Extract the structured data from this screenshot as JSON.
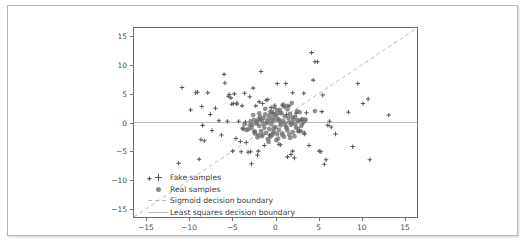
{
  "figure": {
    "background_color": "#ffffff",
    "frame_color": "#b9b9b9",
    "axes_color": "#6f6f6f"
  },
  "chart_data": {
    "type": "scatter",
    "title": "",
    "xlabel": "",
    "ylabel": "",
    "xlim": [
      -16.5,
      16.5
    ],
    "ylim": [
      -16.5,
      16.5
    ],
    "grid": false,
    "legend_position": "lower center",
    "xticks": [
      -15,
      -10,
      -5,
      0,
      5,
      10,
      15
    ],
    "yticks": [
      -15,
      -10,
      -5,
      0,
      5,
      10,
      15
    ],
    "xtick_labels": [
      "−15",
      "−10",
      "−5",
      "0",
      "5",
      "10",
      "15"
    ],
    "ytick_labels": [
      "15",
      "10",
      "5",
      "0",
      "−5",
      "−10",
      "−15"
    ],
    "series": [
      {
        "name": "Fake samples",
        "marker": "plus",
        "color": "#5a5a5a",
        "points": [
          [
            -14.7,
            -9.8
          ],
          [
            -11.3,
            -7.1
          ],
          [
            -10.9,
            6.1
          ],
          [
            -9.9,
            2.2
          ],
          [
            -9.3,
            5.2
          ],
          [
            -9.1,
            5.3
          ],
          [
            -8.9,
            -6.4
          ],
          [
            -8.7,
            -3.0
          ],
          [
            -8.6,
            2.8
          ],
          [
            -8.5,
            -0.5
          ],
          [
            -8.3,
            -3.2
          ],
          [
            -7.6,
            1.4
          ],
          [
            -7.4,
            -1.4
          ],
          [
            -7.0,
            2.5
          ],
          [
            -6.6,
            0.3
          ],
          [
            -6.3,
            -2.2
          ],
          [
            -6.0,
            8.4
          ],
          [
            -5.9,
            6.9
          ],
          [
            -5.6,
            0.2
          ],
          [
            -5.5,
            4.6
          ],
          [
            -5.4,
            4.9
          ],
          [
            -5.2,
            4.3
          ],
          [
            -5.1,
            3.2
          ],
          [
            -5.0,
            -5.0
          ],
          [
            -4.9,
            3.3
          ],
          [
            -4.8,
            5.0
          ],
          [
            -4.6,
            -2.8
          ],
          [
            -4.5,
            3.2
          ],
          [
            -4.3,
            0.2
          ],
          [
            -4.1,
            -3.3
          ],
          [
            -4.0,
            -5.1
          ],
          [
            -3.9,
            2.9
          ],
          [
            -3.8,
            -1.0
          ],
          [
            -3.6,
            5.1
          ],
          [
            -3.5,
            0.1
          ],
          [
            -3.4,
            -3.5
          ],
          [
            -3.2,
            -5.2
          ],
          [
            -3.0,
            4.5
          ],
          [
            -2.9,
            -5.1
          ],
          [
            -2.8,
            -7.2
          ],
          [
            -2.6,
            6.0
          ],
          [
            -2.5,
            -1.6
          ],
          [
            -2.3,
            2.9
          ],
          [
            -2.1,
            -5.7
          ],
          [
            -1.9,
            3.6
          ],
          [
            -1.7,
            8.9
          ],
          [
            -1.5,
            3.3
          ],
          [
            -1.3,
            -4.0
          ],
          [
            -1.1,
            3.9
          ],
          [
            -0.9,
            4.0
          ],
          [
            -0.7,
            -2.2
          ],
          [
            -0.5,
            2.6
          ],
          [
            -0.3,
            1.6
          ],
          [
            -0.1,
            3.0
          ],
          [
            0.2,
            6.8
          ],
          [
            0.4,
            -3.8
          ],
          [
            0.6,
            -3.9
          ],
          [
            0.8,
            3.0
          ],
          [
            1.0,
            2.7
          ],
          [
            1.2,
            6.8
          ],
          [
            1.4,
            -6.0
          ],
          [
            1.6,
            2.9
          ],
          [
            1.8,
            -5.6
          ],
          [
            2.0,
            5.2
          ],
          [
            2.2,
            -6.2
          ],
          [
            2.4,
            1.6
          ],
          [
            2.6,
            -1.6
          ],
          [
            2.8,
            -1.5
          ],
          [
            3.0,
            0.4
          ],
          [
            3.2,
            -0.2
          ],
          [
            3.4,
            -2.0
          ],
          [
            3.6,
            1.7
          ],
          [
            3.9,
            -4.0
          ],
          [
            4.2,
            12.2
          ],
          [
            4.4,
            7.4
          ],
          [
            4.6,
            10.6
          ],
          [
            4.9,
            10.6
          ],
          [
            5.1,
            -5.0
          ],
          [
            5.3,
            -5.1
          ],
          [
            5.5,
            4.8
          ],
          [
            5.7,
            -7.3
          ],
          [
            5.9,
            -6.5
          ],
          [
            6.1,
            -0.5
          ],
          [
            6.3,
            0.2
          ],
          [
            6.5,
            -0.8
          ],
          [
            7.0,
            -2.0
          ],
          [
            8.5,
            1.8
          ],
          [
            9.0,
            -4.2
          ],
          [
            9.6,
            6.8
          ],
          [
            10.2,
            3.3
          ],
          [
            10.8,
            4.1
          ],
          [
            11.0,
            -6.5
          ],
          [
            13.2,
            1.3
          ],
          [
            5.4,
            1.9
          ],
          [
            2.0,
            -5.0
          ],
          [
            -7.9,
            5.2
          ],
          [
            -4.5,
            3.4
          ],
          [
            1.3,
            1.4
          ],
          [
            3.3,
            5.1
          ],
          [
            -2.0,
            -5.0
          ]
        ]
      },
      {
        "name": "Real samples",
        "marker": "circle",
        "color": "#6e6e6e",
        "points": [
          [
            -3.8,
            -1.1
          ],
          [
            -3.4,
            -1.3
          ],
          [
            -3.2,
            -1.2
          ],
          [
            -2.9,
            0.2
          ],
          [
            -2.7,
            -0.4
          ],
          [
            -2.5,
            0.4
          ],
          [
            -2.4,
            -1.9
          ],
          [
            -2.2,
            0.1
          ],
          [
            -2.1,
            -2.6
          ],
          [
            -2.0,
            0.5
          ],
          [
            -1.9,
            -0.6
          ],
          [
            -1.8,
            1.0
          ],
          [
            -1.7,
            -1.5
          ],
          [
            -1.6,
            0.3
          ],
          [
            -1.5,
            -2.1
          ],
          [
            -1.4,
            0.8
          ],
          [
            -1.3,
            -0.9
          ],
          [
            -1.2,
            1.4
          ],
          [
            -1.1,
            -1.8
          ],
          [
            -1.0,
            0.2
          ],
          [
            -0.9,
            -2.9
          ],
          [
            -0.8,
            0.7
          ],
          [
            -0.7,
            -1.2
          ],
          [
            -0.6,
            1.9
          ],
          [
            -0.5,
            -0.3
          ],
          [
            -0.4,
            -2.2
          ],
          [
            -0.3,
            0.9
          ],
          [
            -0.2,
            -1.6
          ],
          [
            -0.1,
            0.4
          ],
          [
            0.0,
            -0.8
          ],
          [
            0.1,
            1.2
          ],
          [
            0.2,
            -2.0
          ],
          [
            0.3,
            0.6
          ],
          [
            0.4,
            -1.3
          ],
          [
            0.5,
            2.2
          ],
          [
            0.6,
            -0.5
          ],
          [
            0.7,
            1.6
          ],
          [
            0.8,
            -1.9
          ],
          [
            0.9,
            0.3
          ],
          [
            1.0,
            -2.5
          ],
          [
            1.1,
            1.1
          ],
          [
            1.2,
            -0.7
          ],
          [
            1.3,
            2.9
          ],
          [
            1.4,
            -1.4
          ],
          [
            1.5,
            0.8
          ],
          [
            1.6,
            -2.1
          ],
          [
            1.7,
            1.5
          ],
          [
            1.8,
            -0.4
          ],
          [
            1.9,
            3.4
          ],
          [
            2.0,
            -1.7
          ],
          [
            2.1,
            0.5
          ],
          [
            2.2,
            -2.4
          ],
          [
            2.3,
            1.0
          ],
          [
            2.4,
            -0.9
          ],
          [
            2.5,
            2.0
          ],
          [
            2.6,
            -1.1
          ],
          [
            2.7,
            0.2
          ],
          [
            2.9,
            -1.5
          ],
          [
            3.1,
            0.6
          ],
          [
            3.3,
            -1.8
          ],
          [
            3.5,
            0.5
          ],
          [
            -0.4,
            1.8
          ],
          [
            0.3,
            -2.8
          ],
          [
            -1.2,
            2.4
          ],
          [
            1.7,
            -2.7
          ],
          [
            -2.6,
            1.3
          ],
          [
            2.8,
            1.8
          ],
          [
            -0.8,
            -3.4
          ],
          [
            0.9,
            3.1
          ],
          [
            -1.6,
            -2.4
          ],
          [
            4.6,
            2.0
          ],
          [
            -2.2,
            -0.2
          ],
          [
            0.1,
            -3.1
          ],
          [
            1.4,
            2.3
          ],
          [
            -0.2,
            -1.0
          ],
          [
            0.6,
            0.0
          ],
          [
            -1.0,
            -0.1
          ],
          [
            2.0,
            0.9
          ],
          [
            -0.6,
            -2.5
          ],
          [
            1.1,
            -0.2
          ],
          [
            -1.8,
            0.6
          ],
          [
            0.5,
            1.7
          ],
          [
            -3.0,
            -0.5
          ],
          [
            3.0,
            -0.6
          ],
          [
            -0.1,
            2.6
          ],
          [
            0.8,
            -2.2
          ],
          [
            -2.4,
            -1.6
          ],
          [
            1.9,
            -0.1
          ],
          [
            -0.5,
            0.3
          ],
          [
            2.3,
            -0.3
          ],
          [
            -1.4,
            -0.3
          ],
          [
            0.2,
            2.1
          ],
          [
            -2.8,
            -1.0
          ],
          [
            1.6,
            0.1
          ],
          [
            -0.3,
            -1.9
          ],
          [
            0.4,
            0.4
          ],
          [
            -1.9,
            1.6
          ],
          [
            2.6,
            0.4
          ],
          [
            -0.7,
            1.3
          ],
          [
            1.3,
            -1.0
          ],
          [
            -2.0,
            -2.2
          ],
          [
            0.0,
            1.5
          ],
          [
            3.4,
            0.3
          ],
          [
            -3.6,
            -0.3
          ]
        ]
      }
    ],
    "lines": [
      {
        "name": "Sigmoid decision boundary",
        "style": "dashed",
        "color": "#b4b4b4",
        "from": [
          -16.5,
          -16.5
        ],
        "to": [
          16.5,
          16.5
        ]
      },
      {
        "name": "Least squares decision boundary",
        "style": "solid",
        "color": "#b4b4b4",
        "from": [
          -16.5,
          0
        ],
        "to": [
          16.5,
          0
        ]
      }
    ],
    "legend": [
      {
        "label": "Fake samples",
        "glyph": "plus-marker"
      },
      {
        "label": "Real samples",
        "glyph": "circle-marker"
      },
      {
        "label": "Sigmoid decision boundary",
        "glyph": "dashed-line"
      },
      {
        "label": "Least squares decision boundary",
        "glyph": "solid-line"
      }
    ]
  }
}
